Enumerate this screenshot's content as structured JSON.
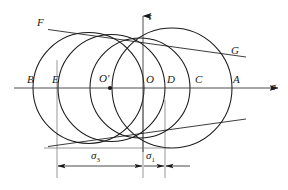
{
  "figure": {
    "type": "mohr-circle-diagram",
    "background": "#ffffff",
    "stroke_color": "#1a1a1a",
    "axes": {
      "horizontal": {
        "name": "sigma-axis",
        "label": "σ",
        "y": 88,
        "x_start": 14,
        "x_end": 282,
        "arrow": "right"
      },
      "vertical": {
        "name": "tau-axis",
        "label": "τ",
        "x": 143,
        "y_start": 16,
        "y_end": 152,
        "arrow": "up"
      }
    },
    "point_labels": [
      {
        "name": "point-B",
        "text": "B",
        "x": 28,
        "y": 80
      },
      {
        "name": "point-E",
        "text": "E",
        "x": 54,
        "y": 80
      },
      {
        "name": "point-O-prime",
        "text": "O′",
        "x": 100,
        "y": 79
      },
      {
        "name": "point-O",
        "text": "O",
        "x": 147,
        "y": 80
      },
      {
        "name": "point-D",
        "text": "D",
        "x": 168,
        "y": 80
      },
      {
        "name": "point-C",
        "text": "C",
        "x": 196,
        "y": 80
      },
      {
        "name": "point-A",
        "text": "A",
        "x": 234,
        "y": 80
      },
      {
        "name": "point-F",
        "text": "F",
        "x": 38,
        "y": 22
      },
      {
        "name": "point-G",
        "text": "G",
        "x": 232,
        "y": 50
      }
    ],
    "center_dot": {
      "name": "center-O-prime-dot",
      "x": 110,
      "y": 88,
      "r": 2.1
    },
    "circles": [
      {
        "name": "mohr-circle-1",
        "cx": 88.5,
        "cy": 88,
        "r": 55.5
      },
      {
        "name": "mohr-circle-2",
        "cx": 111.5,
        "cy": 88,
        "r": 53.5
      },
      {
        "name": "mohr-circle-3",
        "cx": 140.0,
        "cy": 88,
        "r": 50.0
      },
      {
        "name": "mohr-circle-4",
        "cx": 172.0,
        "cy": 88,
        "r": 60.0
      }
    ],
    "envelopes": [
      {
        "name": "upper-envelope-line",
        "x1": 48,
        "y1": 29,
        "x2": 245,
        "y2": 56
      },
      {
        "name": "lower-envelope-line",
        "x1": 48,
        "y1": 147,
        "x2": 245,
        "y2": 120
      }
    ],
    "guides": [
      {
        "name": "guide-line-E",
        "x": 57,
        "y1": 88,
        "y2": 178
      },
      {
        "name": "guide-line-O",
        "x": 143,
        "y1": 88,
        "y2": 178
      },
      {
        "name": "guide-line-D",
        "x": 165,
        "y1": 88,
        "y2": 178
      }
    ],
    "dimensions": [
      {
        "name": "dimension-sigma3",
        "label": "σ",
        "sub": "3",
        "x1": 57,
        "x2": 143,
        "y": 166,
        "label_x": 93,
        "label_y": 152
      },
      {
        "name": "dimension-sigma1",
        "label": "σ",
        "sub": "1",
        "x1": 143,
        "x2": 165,
        "y": 166,
        "label_x": 147,
        "label_y": 152
      }
    ],
    "extension_line": {
      "name": "lower-extension-line",
      "x1": 44,
      "y1": 149,
      "x2": 168,
      "y2": 149
    }
  }
}
